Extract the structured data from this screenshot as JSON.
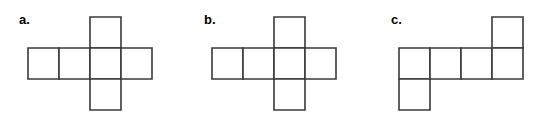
{
  "figure": {
    "width": 541,
    "height": 122,
    "background_color": "#ffffff",
    "stroke_color": "#3a3a3a",
    "fill_color": "#ffffff",
    "cell_size": 31
  },
  "nets": [
    {
      "id": "net-a",
      "label": "a.",
      "label_x": 19,
      "label_y": 13,
      "cells": [
        {
          "name": "top-square",
          "col": 2,
          "row": 0
        },
        {
          "name": "middle-square-1",
          "col": 0,
          "row": 1
        },
        {
          "name": "middle-square-2",
          "col": 1,
          "row": 1
        },
        {
          "name": "middle-square-3",
          "col": 2,
          "row": 1
        },
        {
          "name": "middle-square-4",
          "col": 3,
          "row": 1
        },
        {
          "name": "bottom-square",
          "col": 2,
          "row": 2
        }
      ],
      "origin_x": 28,
      "origin_y": 17,
      "cols": 4,
      "rows": 3
    },
    {
      "id": "net-b",
      "label": "b.",
      "label_x": 204,
      "label_y": 13,
      "cells": [
        {
          "name": "top-square",
          "col": 2,
          "row": 0
        },
        {
          "name": "middle-square-1",
          "col": 0,
          "row": 1
        },
        {
          "name": "middle-square-2",
          "col": 1,
          "row": 1
        },
        {
          "name": "middle-square-3",
          "col": 2,
          "row": 1
        },
        {
          "name": "middle-square-4",
          "col": 3,
          "row": 1
        },
        {
          "name": "bottom-square",
          "col": 2,
          "row": 2
        }
      ],
      "origin_x": 212,
      "origin_y": 17,
      "cols": 4,
      "rows": 3
    },
    {
      "id": "net-c",
      "label": "c.",
      "label_x": 391,
      "label_y": 13,
      "cells": [
        {
          "name": "top-square",
          "col": 3,
          "row": 0
        },
        {
          "name": "middle-square-1",
          "col": 0,
          "row": 1
        },
        {
          "name": "middle-square-2",
          "col": 1,
          "row": 1
        },
        {
          "name": "middle-square-3",
          "col": 2,
          "row": 1
        },
        {
          "name": "middle-square-4",
          "col": 3,
          "row": 1
        },
        {
          "name": "bottom-square",
          "col": 0,
          "row": 2
        }
      ],
      "origin_x": 399,
      "origin_y": 17,
      "cols": 4,
      "rows": 3
    }
  ]
}
